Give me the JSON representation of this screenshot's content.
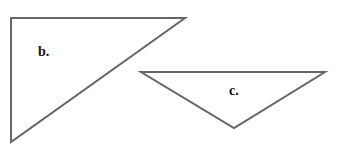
{
  "figure": {
    "stroke_color": "#666666",
    "triangles": [
      {
        "label": "b.",
        "points": "11,18 185,18 11,142"
      },
      {
        "label": "c.",
        "points": "141,72 325,72 234,128"
      }
    ]
  }
}
